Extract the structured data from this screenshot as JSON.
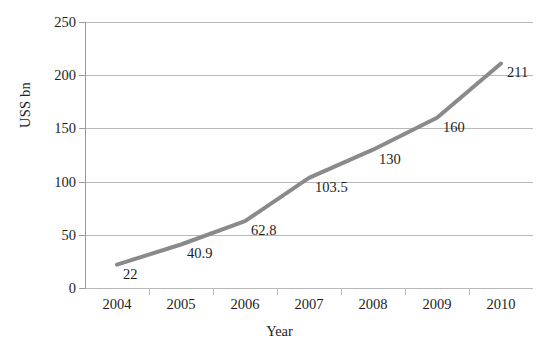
{
  "chart_data": {
    "type": "line",
    "title": "",
    "subtitle": "",
    "xlabel": "Year",
    "ylabel": "USS bn",
    "categories": [
      "2004",
      "2005",
      "2006",
      "2007",
      "2008",
      "2009",
      "2010"
    ],
    "values": [
      22,
      40.9,
      62.8,
      103.5,
      130,
      160,
      211
    ],
    "point_labels": [
      "22",
      "40.9",
      "62.8",
      "103.5",
      "130",
      "160",
      "211"
    ],
    "series": [
      {
        "name": "",
        "values": [
          22,
          40.9,
          62.8,
          103.5,
          130,
          160,
          211
        ]
      }
    ],
    "ylim": [
      0,
      250
    ],
    "ytick_labels": [
      "0",
      "50",
      "100",
      "150",
      "200",
      "250"
    ],
    "ytick_values": [
      0,
      50,
      100,
      150,
      200,
      250
    ],
    "xtick_labels": [
      "2004",
      "2005",
      "2006",
      "2007",
      "2008",
      "2009",
      "2010"
    ],
    "grid": "horizontal",
    "legend": "none",
    "markers": "none",
    "line_color": "#8a8a8a",
    "gridline_color": "#b9b9b9",
    "axis_color": "#9a9a9a",
    "text_color": "#1d1d1d",
    "background_color": "#ffffff"
  }
}
